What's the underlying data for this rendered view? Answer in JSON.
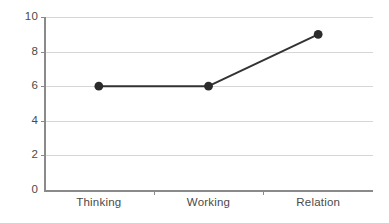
{
  "chart_data": {
    "type": "line",
    "title": "",
    "xlabel": "",
    "ylabel": "",
    "categories": [
      "Thinking",
      "Working",
      "Relation"
    ],
    "values": [
      6,
      6,
      9
    ],
    "series": [
      {
        "name": "",
        "values": [
          6,
          6,
          9
        ]
      }
    ],
    "ylim": [
      0,
      10
    ],
    "y_ticks": [
      0,
      2,
      4,
      6,
      8,
      10
    ],
    "y_tick_labels": [
      "0",
      "2",
      "4",
      "6",
      "8",
      "10"
    ],
    "x_tick_labels": [
      "Thinking",
      "Working",
      "Relation"
    ],
    "grid": true,
    "grid_axis": "y",
    "legend": false,
    "legend_position": "none",
    "marker": "circle",
    "colors": {
      "line": "#333333",
      "marker": "#2b2b2b",
      "grid": "#d6d6d6",
      "axis": "#8a8a8a",
      "text": "#4a4a4a",
      "background": "#ffffff"
    }
  }
}
